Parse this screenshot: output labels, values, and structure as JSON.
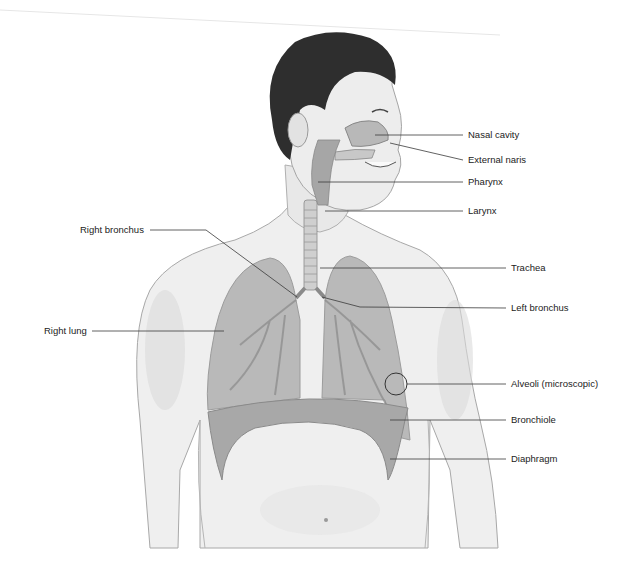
{
  "diagram": {
    "palette": {
      "skin": "#efefef",
      "skin_shade": "#d4d4d4",
      "outline": "#9a9a9a",
      "hair": "#2e2e2e",
      "lung": "#a9a9a9",
      "airway": "#8c8c8c",
      "diaphragm": "#9e9e9e",
      "leader_line": "#3a3a3a",
      "text": "#222222"
    },
    "labels_right": [
      {
        "id": "nasal-cavity",
        "text": "Nasal cavity"
      },
      {
        "id": "external-naris",
        "text": "External naris"
      },
      {
        "id": "pharynx",
        "text": "Pharynx"
      },
      {
        "id": "larynx",
        "text": "Larynx"
      },
      {
        "id": "trachea",
        "text": "Trachea"
      },
      {
        "id": "left-bronchus",
        "text": "Left bronchus"
      },
      {
        "id": "alveoli",
        "text": "Alveoli (microscopic)"
      },
      {
        "id": "bronchiole",
        "text": "Bronchiole"
      },
      {
        "id": "diaphragm",
        "text": "Diaphragm"
      }
    ],
    "labels_left": [
      {
        "id": "right-bronchus",
        "text": "Right bronchus"
      },
      {
        "id": "right-lung",
        "text": "Right lung"
      }
    ]
  }
}
